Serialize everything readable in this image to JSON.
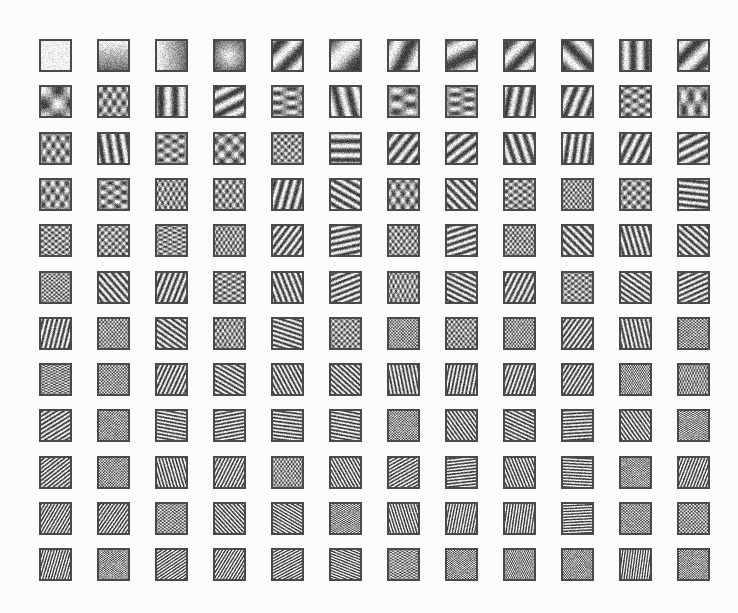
{
  "figure": {
    "rows": 12,
    "cols": 12,
    "origin": {
      "x": 39,
      "y": 39
    },
    "step": {
      "x": 58,
      "y": 46.3
    },
    "tile_size": 33,
    "colors": {
      "background": "#fbfbfa",
      "border": "#4a4a4a",
      "dark": "#3a3a3a",
      "light": "#f6f6f4"
    }
  },
  "row1_tiles": [
    {
      "fx": 0,
      "fy": 0,
      "kind": "flat"
    },
    {
      "fx": 0,
      "fy": 0.5,
      "kind": "vertical-gradient"
    },
    {
      "fx": 0.5,
      "fy": 0,
      "kind": "horizontal-gradient"
    },
    {
      "fx": 0,
      "fy": 0,
      "kind": "center-blob"
    },
    {
      "fx": 1,
      "fy": 1,
      "kind": "cross"
    },
    {
      "fx": 0.5,
      "fy": 0.5,
      "kind": "diagonal-gradient"
    },
    {
      "fx": 1,
      "fy": 0.5,
      "kind": "two-blobs"
    },
    {
      "fx": 0.5,
      "fy": 1,
      "kind": "two-blobs"
    },
    {
      "fx": 1,
      "fy": 1,
      "kind": "saddle"
    },
    {
      "fx": 1,
      "fy": -1,
      "kind": "diagonal-band"
    },
    {
      "fx": 2,
      "fy": 0,
      "kind": "vertical-stripes"
    },
    {
      "fx": 1,
      "fy": 1,
      "kind": "diagonal-band"
    }
  ]
}
